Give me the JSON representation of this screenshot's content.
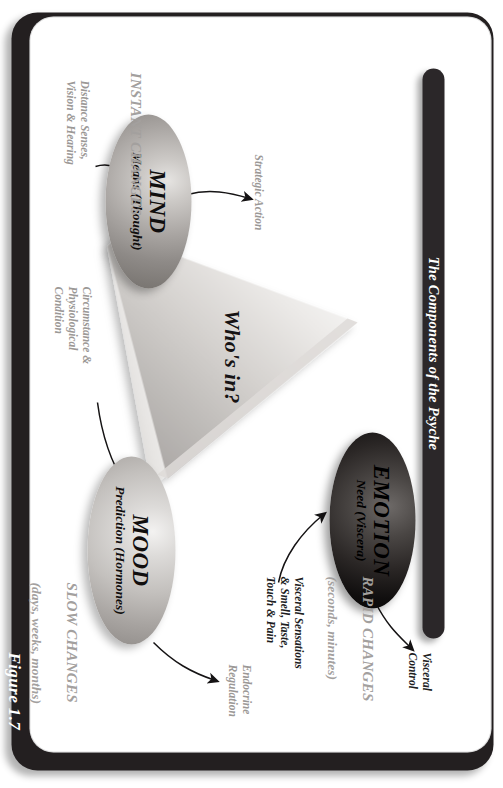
{
  "figure": {
    "number_label": "Figure 1.7",
    "title": "The Components of the Psyche"
  },
  "center": {
    "question": "Who's in?"
  },
  "nodes": [
    {
      "id": "emotion",
      "title": "EMOTION",
      "subtitle": "Need (Viscera)",
      "fill": "#171413"
    },
    {
      "id": "mind",
      "title": "MIND",
      "subtitle": "Means (Thought)",
      "fill": "#a9a5a2"
    },
    {
      "id": "mood",
      "title": "MOOD",
      "subtitle": "Prediction (Hormones)",
      "fill": "#c3c0bd"
    }
  ],
  "annotations": {
    "visceral_control": "Visceral\nControl",
    "visceral_sensations": "Visceral Sensations\n& Smell, Taste,\nTouch & Pain",
    "strategic_action": "Strategic Action",
    "distance_senses": "Distance Senses,\nVision & Hearing",
    "circumstance": "Circumstance &\nPhysiological\nCondition",
    "endocrine": "Endocrine\nRegulation"
  },
  "categories": {
    "rapid": {
      "main": "RAPID CHANGES",
      "sub": "(seconds, minutes)"
    },
    "instant": {
      "main": "INSTANT CHANGES",
      "sub": ""
    },
    "slow": {
      "main": "SLOW CHANGES",
      "sub": "(days, weeks, months)"
    }
  },
  "colors": {
    "frame": "#231f20",
    "title_bar": "#2b2729",
    "paper": "#ffffff",
    "muted_text": "#a3a09e",
    "body_text": "#201d1e"
  }
}
